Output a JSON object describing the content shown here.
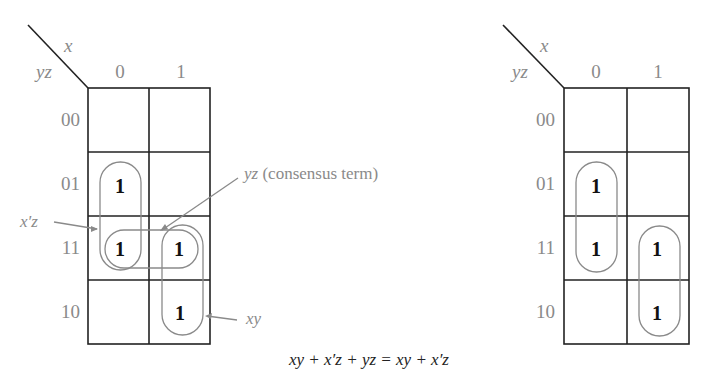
{
  "maps": [
    {
      "id": "left",
      "corner_labels": {
        "col_var": "x",
        "row_var": "yz"
      },
      "col_headers": [
        "0",
        "1"
      ],
      "row_headers": [
        "00",
        "01",
        "11",
        "10"
      ],
      "cells": [
        [
          "",
          ""
        ],
        [
          "1",
          ""
        ],
        [
          "1",
          "1"
        ],
        [
          "",
          "1"
        ]
      ],
      "groupings": [
        "x'z",
        "xy",
        "yz"
      ]
    },
    {
      "id": "right",
      "corner_labels": {
        "col_var": "x",
        "row_var": "yz"
      },
      "col_headers": [
        "0",
        "1"
      ],
      "row_headers": [
        "00",
        "01",
        "11",
        "10"
      ],
      "cells": [
        [
          "",
          ""
        ],
        [
          "1",
          ""
        ],
        [
          "1",
          "1"
        ],
        [
          "",
          "1"
        ]
      ],
      "groupings": [
        "x'z",
        "xy"
      ]
    }
  ],
  "annotations": {
    "xprime_z": "x′z",
    "consensus_var": "yz",
    "consensus_text": " (consensus term)",
    "xy": "xy"
  },
  "equation": "xy + x′z + yz = xy + x′z"
}
